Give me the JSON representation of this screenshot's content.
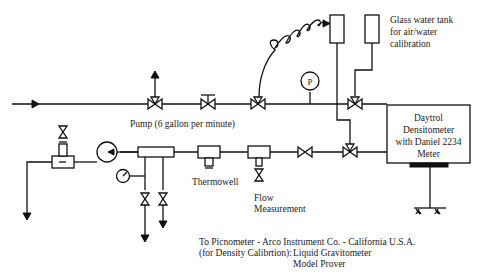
{
  "diagram": {
    "type": "process-flow-schematic",
    "labels": {
      "glass_tank_line1": "Glass water tank",
      "glass_tank_line2": "for air/water",
      "glass_tank_line3": "calibration",
      "pump": "Pump (6 gallon per minute)",
      "densitometer_line1": "Daytrol",
      "densitometer_line2": "Densitometer",
      "densitometer_line3": "with Daniel 2234",
      "densitometer_line4": "Meter",
      "thermowell": "Thermowell",
      "flow_line1": "Flow",
      "flow_line2": "Measurement",
      "pressure_gauge": "P",
      "picnometer_line1": "To Picnometer - Arco Instrument Co. - California U.S.A.",
      "picnometer_line2_prefix": "(for Density Calibrtion):",
      "picnometer_line2_value": "Liquid Gravitometer",
      "picnometer_line3": "Model Prover"
    },
    "colors": {
      "line": "#111111",
      "text": "#222222",
      "background": "#ffffff"
    },
    "components": [
      {
        "id": "inlet-arrow",
        "kind": "flow-arrow"
      },
      {
        "id": "three-way-valve-vent",
        "kind": "three-way-valve"
      },
      {
        "id": "gate-valve-main",
        "kind": "globe-valve"
      },
      {
        "id": "three-way-valve-coil",
        "kind": "three-way-valve"
      },
      {
        "id": "pressure-gauge",
        "kind": "gauge"
      },
      {
        "id": "three-way-valve-tank",
        "kind": "three-way-valve"
      },
      {
        "id": "tank-1",
        "kind": "tank"
      },
      {
        "id": "tank-2",
        "kind": "glass-water-tank"
      },
      {
        "id": "densitometer",
        "kind": "instrument-box"
      },
      {
        "id": "three-way-valve-lower",
        "kind": "three-way-valve"
      },
      {
        "id": "gate-valve-lower",
        "kind": "gate-valve"
      },
      {
        "id": "flow-meter",
        "kind": "flow-measurement"
      },
      {
        "id": "thermowell",
        "kind": "thermowell"
      },
      {
        "id": "manifold",
        "kind": "manifold"
      },
      {
        "id": "drain-valve-1",
        "kind": "gate-valve"
      },
      {
        "id": "drain-valve-2",
        "kind": "gate-valve"
      },
      {
        "id": "small-gauge",
        "kind": "gauge"
      },
      {
        "id": "pump",
        "kind": "pump"
      },
      {
        "id": "sight-glass",
        "kind": "sample-point"
      },
      {
        "id": "outlet-arrow",
        "kind": "flow-arrow"
      }
    ]
  }
}
